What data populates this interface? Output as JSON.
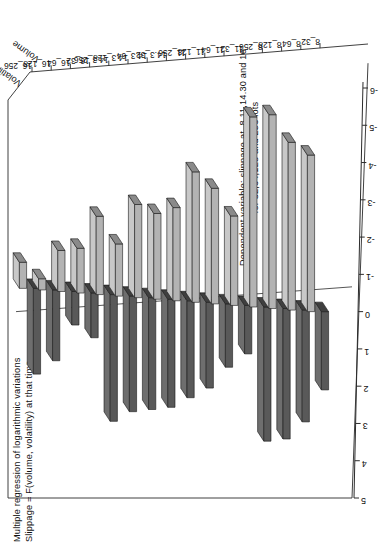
{
  "title": {
    "line1": "Multiple regression of logarithmic variations",
    "line2": "Slippage = F(volume, volatility) at that time"
  },
  "caption": {
    "line1": "Dependent variable: slippage at  8,11,14.30 and 16",
    "line2": "for 32,64,128 and 256 lots"
  },
  "axes": {
    "value_axis_title": "T_value",
    "series_axis_top": "Volatility",
    "series_axis_bottom": "Volume"
  },
  "colors": {
    "volatility": "#595959",
    "volatility_top": "#6e6e6e",
    "volatility_side": "#3f3f3f",
    "volume": "#b3b3b3",
    "volume_top": "#c8c8c8",
    "volume_side": "#8a8a8a",
    "axis": "#2b2b2b",
    "background": "#ffffff"
  },
  "chart_data": {
    "type": "bar",
    "xlabel": "",
    "ylabel": "T_value",
    "ylim": [
      -6,
      5
    ],
    "yticks": [
      "5",
      "4",
      "3",
      "2",
      "1",
      "0",
      "-1",
      "-2",
      "-3",
      "-4",
      "-5",
      "-6"
    ],
    "grid": false,
    "legend_position": "axis-labels-top-right",
    "categories": [
      "8_32",
      "8_64",
      "8_128",
      "8_256",
      "11_32",
      "11_64",
      "11_128",
      "11_256",
      "14.3_32",
      "14.3_64",
      "14.3_128",
      "14.3_256",
      "16_32",
      "16_64",
      "16_128",
      "16_256"
    ],
    "series": [
      {
        "name": "Volatility",
        "color": "#595959",
        "values": [
          2.1,
          3.0,
          3.5,
          3.6,
          1.3,
          1.7,
          2.3,
          2.6,
          2.9,
          3.0,
          3.1,
          3.4,
          1.2,
          0.9,
          1.9,
          2.3
        ]
      },
      {
        "name": "Volume",
        "color": "#b3b3b3",
        "values": [
          -4.2,
          -4.5,
          -5.2,
          -5.1,
          -2.4,
          -3.1,
          -3.5,
          -2.5,
          -2.3,
          -2.5,
          -1.4,
          -2.1,
          -1.2,
          -1.1,
          -0.3,
          -0.7
        ]
      }
    ]
  }
}
